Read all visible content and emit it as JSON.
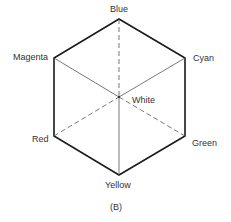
{
  "diagram": {
    "caption": "(B)",
    "vertices": {
      "blue": {
        "label": "Blue",
        "x": 119,
        "y": 19
      },
      "cyan": {
        "label": "Cyan",
        "x": 185,
        "y": 58
      },
      "green": {
        "label": "Green",
        "x": 185,
        "y": 136
      },
      "yellow": {
        "label": "Yellow",
        "x": 119,
        "y": 175
      },
      "red": {
        "label": "Red",
        "x": 54,
        "y": 136
      },
      "magenta": {
        "label": "Magenta",
        "x": 54,
        "y": 58
      },
      "white": {
        "label": "White",
        "x": 119,
        "y": 97
      }
    },
    "edges": {
      "outline": [
        "blue-cyan",
        "cyan-green",
        "green-yellow",
        "yellow-red",
        "red-magenta",
        "magenta-blue"
      ],
      "solid_inner": [
        "magenta-white",
        "cyan-white",
        "white-yellow"
      ],
      "dashed_inner": [
        "blue-white",
        "red-white",
        "white-green"
      ]
    },
    "colors": {
      "outline": "#1a1a1a",
      "inner": "#555555",
      "text": "#333333"
    }
  }
}
